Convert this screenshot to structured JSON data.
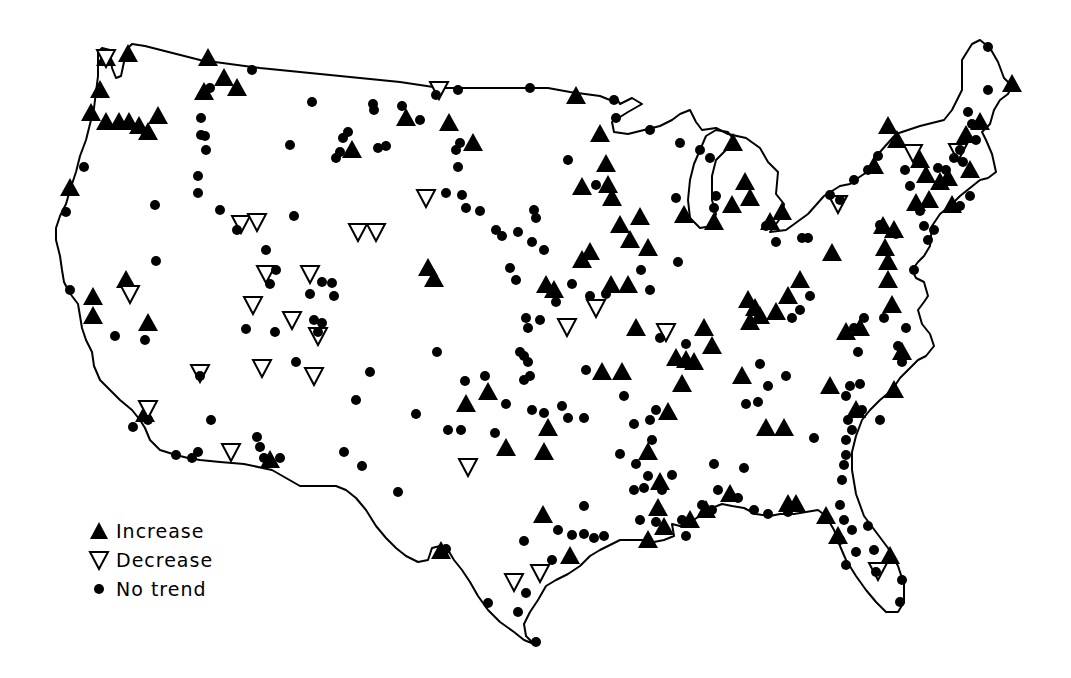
{
  "legend": {
    "items": [
      {
        "symbol": "filled-triangle-up",
        "label": "Increase"
      },
      {
        "symbol": "open-triangle-down",
        "label": "Decrease"
      },
      {
        "symbol": "filled-dot",
        "label": "No trend"
      }
    ]
  },
  "map": {
    "region": "Contiguous United States",
    "colors": {
      "outline": "#000000",
      "marker": "#000000",
      "background": "#ffffff"
    },
    "increase": [
      [
        106,
        58
      ],
      [
        128,
        54
      ],
      [
        100,
        90
      ],
      [
        91,
        113
      ],
      [
        106,
        122
      ],
      [
        119,
        122
      ],
      [
        129,
        122
      ],
      [
        139,
        126
      ],
      [
        148,
        132
      ],
      [
        158,
        116
      ],
      [
        70,
        188
      ],
      [
        93,
        297
      ],
      [
        93,
        316
      ],
      [
        126,
        280
      ],
      [
        148,
        323
      ],
      [
        208,
        58
      ],
      [
        224,
        78
      ],
      [
        237,
        88
      ],
      [
        204,
        92
      ],
      [
        406,
        118
      ],
      [
        352,
        150
      ],
      [
        449,
        123
      ],
      [
        473,
        143
      ],
      [
        428,
        268
      ],
      [
        434,
        279
      ],
      [
        576,
        96
      ],
      [
        600,
        134
      ],
      [
        606,
        164
      ],
      [
        582,
        187
      ],
      [
        608,
        185
      ],
      [
        612,
        198
      ],
      [
        640,
        217
      ],
      [
        620,
        225
      ],
      [
        630,
        240
      ],
      [
        648,
        248
      ],
      [
        582,
        260
      ],
      [
        590,
        252
      ],
      [
        611,
        285
      ],
      [
        628,
        285
      ],
      [
        546,
        285
      ],
      [
        554,
        290
      ],
      [
        636,
        328
      ],
      [
        602,
        372
      ],
      [
        622,
        372
      ],
      [
        684,
        215
      ],
      [
        733,
        143
      ],
      [
        714,
        222
      ],
      [
        745,
        182
      ],
      [
        750,
        198
      ],
      [
        732,
        205
      ],
      [
        770,
        222
      ],
      [
        782,
        212
      ],
      [
        888,
        126
      ],
      [
        874,
        166
      ],
      [
        897,
        140
      ],
      [
        920,
        160
      ],
      [
        926,
        175
      ],
      [
        966,
        135
      ],
      [
        980,
        122
      ],
      [
        948,
        178
      ],
      [
        970,
        170
      ],
      [
        1012,
        84
      ],
      [
        952,
        205
      ],
      [
        929,
        200
      ],
      [
        940,
        182
      ],
      [
        916,
        203
      ],
      [
        883,
        226
      ],
      [
        894,
        230
      ],
      [
        885,
        248
      ],
      [
        888,
        262
      ],
      [
        888,
        280
      ],
      [
        892,
        305
      ],
      [
        832,
        253
      ],
      [
        800,
        280
      ],
      [
        788,
        296
      ],
      [
        776,
        312
      ],
      [
        748,
        300
      ],
      [
        755,
        308
      ],
      [
        760,
        316
      ],
      [
        750,
        322
      ],
      [
        704,
        328
      ],
      [
        712,
        346
      ],
      [
        694,
        362
      ],
      [
        686,
        360
      ],
      [
        676,
        358
      ],
      [
        682,
        384
      ],
      [
        742,
        376
      ],
      [
        668,
        412
      ],
      [
        766,
        428
      ],
      [
        784,
        428
      ],
      [
        830,
        386
      ],
      [
        860,
        328
      ],
      [
        846,
        332
      ],
      [
        902,
        352
      ],
      [
        894,
        390
      ],
      [
        856,
        410
      ],
      [
        548,
        428
      ],
      [
        544,
        452
      ],
      [
        466,
        404
      ],
      [
        488,
        392
      ],
      [
        506,
        448
      ],
      [
        648,
        452
      ],
      [
        660,
        482
      ],
      [
        658,
        508
      ],
      [
        664,
        527
      ],
      [
        648,
        540
      ],
      [
        690,
        520
      ],
      [
        706,
        510
      ],
      [
        730,
        494
      ],
      [
        788,
        504
      ],
      [
        796,
        504
      ],
      [
        826,
        516
      ],
      [
        838,
        536
      ],
      [
        890,
        556
      ],
      [
        543,
        515
      ],
      [
        441,
        551
      ],
      [
        570,
        556
      ],
      [
        270,
        460
      ],
      [
        145,
        414
      ]
    ],
    "decrease": [
      [
        106,
        58
      ],
      [
        439,
        90
      ],
      [
        426,
        198
      ],
      [
        241,
        224
      ],
      [
        257,
        222
      ],
      [
        358,
        232
      ],
      [
        376,
        232
      ],
      [
        266,
        274
      ],
      [
        310,
        274
      ],
      [
        130,
        294
      ],
      [
        253,
        305
      ],
      [
        292,
        320
      ],
      [
        318,
        336
      ],
      [
        200,
        373
      ],
      [
        262,
        368
      ],
      [
        314,
        376
      ],
      [
        148,
        409
      ],
      [
        231,
        452
      ],
      [
        468,
        467
      ],
      [
        567,
        327
      ],
      [
        596,
        308
      ],
      [
        666,
        332
      ],
      [
        514,
        582
      ],
      [
        540,
        573
      ],
      [
        838,
        204
      ],
      [
        913,
        153
      ],
      [
        958,
        152
      ],
      [
        878,
        571
      ]
    ],
    "no_trend": [
      [
        84,
        167
      ],
      [
        66,
        212
      ],
      [
        70,
        290
      ],
      [
        115,
        336
      ],
      [
        145,
        340
      ],
      [
        155,
        205
      ],
      [
        156,
        261
      ],
      [
        201,
        118
      ],
      [
        201,
        135
      ],
      [
        206,
        150
      ],
      [
        198,
        176
      ],
      [
        198,
        193
      ],
      [
        220,
        210
      ],
      [
        205,
        136
      ],
      [
        210,
        88
      ],
      [
        252,
        70
      ],
      [
        237,
        230
      ],
      [
        294,
        216
      ],
      [
        266,
        250
      ],
      [
        270,
        284
      ],
      [
        276,
        270
      ],
      [
        246,
        329
      ],
      [
        275,
        332
      ],
      [
        322,
        282
      ],
      [
        332,
        283
      ],
      [
        334,
        296
      ],
      [
        310,
        294
      ],
      [
        314,
        320
      ],
      [
        322,
        323
      ],
      [
        318,
        332
      ],
      [
        296,
        362
      ],
      [
        211,
        420
      ],
      [
        200,
        376
      ],
      [
        257,
        437
      ],
      [
        260,
        447
      ],
      [
        264,
        458
      ],
      [
        280,
        458
      ],
      [
        148,
        420
      ],
      [
        133,
        427
      ],
      [
        176,
        455
      ],
      [
        192,
        458
      ],
      [
        198,
        452
      ],
      [
        312,
        102
      ],
      [
        373,
        104
      ],
      [
        374,
        110
      ],
      [
        402,
        106
      ],
      [
        420,
        120
      ],
      [
        386,
        146
      ],
      [
        378,
        148
      ],
      [
        348,
        132
      ],
      [
        343,
        138
      ],
      [
        336,
        158
      ],
      [
        340,
        152
      ],
      [
        290,
        145
      ],
      [
        458,
        90
      ],
      [
        436,
        95
      ],
      [
        460,
        143
      ],
      [
        456,
        150
      ],
      [
        458,
        167
      ],
      [
        446,
        193
      ],
      [
        462,
        195
      ],
      [
        466,
        208
      ],
      [
        480,
        211
      ],
      [
        496,
        230
      ],
      [
        502,
        236
      ],
      [
        518,
        232
      ],
      [
        534,
        210
      ],
      [
        536,
        218
      ],
      [
        532,
        242
      ],
      [
        544,
        250
      ],
      [
        510,
        268
      ],
      [
        516,
        280
      ],
      [
        568,
        160
      ],
      [
        596,
        185
      ],
      [
        530,
        88
      ],
      [
        616,
        118
      ],
      [
        650,
        130
      ],
      [
        680,
        143
      ],
      [
        700,
        150
      ],
      [
        710,
        158
      ],
      [
        716,
        196
      ],
      [
        714,
        208
      ],
      [
        676,
        198
      ],
      [
        678,
        262
      ],
      [
        650,
        290
      ],
      [
        641,
        270
      ],
      [
        556,
        302
      ],
      [
        572,
        284
      ],
      [
        606,
        294
      ],
      [
        590,
        296
      ],
      [
        526,
        318
      ],
      [
        540,
        320
      ],
      [
        528,
        328
      ],
      [
        520,
        352
      ],
      [
        524,
        356
      ],
      [
        528,
        362
      ],
      [
        530,
        376
      ],
      [
        524,
        380
      ],
      [
        437,
        352
      ],
      [
        465,
        381
      ],
      [
        485,
        376
      ],
      [
        461,
        430
      ],
      [
        448,
        430
      ],
      [
        416,
        414
      ],
      [
        370,
        372
      ],
      [
        356,
        400
      ],
      [
        344,
        452
      ],
      [
        362,
        466
      ],
      [
        398,
        492
      ],
      [
        495,
        433
      ],
      [
        506,
        404
      ],
      [
        532,
        410
      ],
      [
        544,
        413
      ],
      [
        562,
        406
      ],
      [
        568,
        418
      ],
      [
        584,
        418
      ],
      [
        586,
        370
      ],
      [
        624,
        396
      ],
      [
        656,
        410
      ],
      [
        650,
        420
      ],
      [
        634,
        424
      ],
      [
        652,
        440
      ],
      [
        620,
        454
      ],
      [
        636,
        464
      ],
      [
        648,
        476
      ],
      [
        644,
        488
      ],
      [
        634,
        490
      ],
      [
        662,
        490
      ],
      [
        672,
        475
      ],
      [
        682,
        520
      ],
      [
        686,
        536
      ],
      [
        714,
        464
      ],
      [
        744,
        468
      ],
      [
        718,
        490
      ],
      [
        738,
        498
      ],
      [
        754,
        510
      ],
      [
        768,
        514
      ],
      [
        788,
        512
      ],
      [
        640,
        520
      ],
      [
        656,
        522
      ],
      [
        702,
        505
      ],
      [
        712,
        510
      ],
      [
        746,
        404
      ],
      [
        758,
        402
      ],
      [
        768,
        386
      ],
      [
        786,
        376
      ],
      [
        760,
        364
      ],
      [
        792,
        318
      ],
      [
        800,
        310
      ],
      [
        810,
        296
      ],
      [
        802,
        238
      ],
      [
        808,
        238
      ],
      [
        776,
        242
      ],
      [
        766,
        226
      ],
      [
        840,
        200
      ],
      [
        830,
        195
      ],
      [
        854,
        180
      ],
      [
        868,
        170
      ],
      [
        878,
        156
      ],
      [
        905,
        170
      ],
      [
        910,
        186
      ],
      [
        920,
        211
      ],
      [
        924,
        226
      ],
      [
        928,
        240
      ],
      [
        934,
        230
      ],
      [
        960,
        206
      ],
      [
        970,
        196
      ],
      [
        938,
        168
      ],
      [
        946,
        170
      ],
      [
        896,
        234
      ],
      [
        880,
        225
      ],
      [
        914,
        270
      ],
      [
        884,
        318
      ],
      [
        906,
        328
      ],
      [
        898,
        346
      ],
      [
        902,
        362
      ],
      [
        858,
        352
      ],
      [
        854,
        328
      ],
      [
        864,
        318
      ],
      [
        850,
        386
      ],
      [
        846,
        396
      ],
      [
        860,
        384
      ],
      [
        848,
        420
      ],
      [
        852,
        430
      ],
      [
        846,
        440
      ],
      [
        846,
        455
      ],
      [
        844,
        465
      ],
      [
        842,
        480
      ],
      [
        840,
        505
      ],
      [
        844,
        520
      ],
      [
        852,
        530
      ],
      [
        868,
        526
      ],
      [
        856,
        552
      ],
      [
        874,
        550
      ],
      [
        876,
        572
      ],
      [
        902,
        580
      ],
      [
        900,
        602
      ],
      [
        840,
        540
      ],
      [
        846,
        565
      ],
      [
        814,
        438
      ],
      [
        880,
        420
      ],
      [
        862,
        410
      ],
      [
        584,
        506
      ],
      [
        558,
        530
      ],
      [
        572,
        535
      ],
      [
        584,
        534
      ],
      [
        594,
        538
      ],
      [
        604,
        536
      ],
      [
        552,
        560
      ],
      [
        524,
        541
      ],
      [
        526,
        593
      ],
      [
        536,
        642
      ],
      [
        488,
        603
      ],
      [
        518,
        612
      ],
      [
        446,
        549
      ],
      [
        660,
        338
      ],
      [
        686,
        344
      ],
      [
        614,
        100
      ],
      [
        988,
        47
      ],
      [
        988,
        90
      ],
      [
        968,
        112
      ],
      [
        972,
        124
      ],
      [
        976,
        140
      ],
      [
        960,
        150
      ],
      [
        954,
        158
      ],
      [
        963,
        162
      ]
    ]
  }
}
